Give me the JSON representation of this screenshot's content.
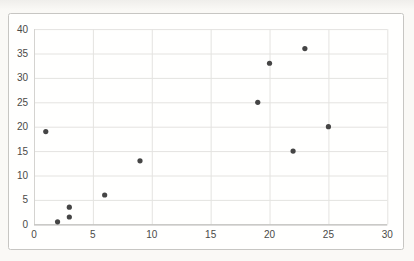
{
  "chart_data": {
    "type": "scatter",
    "title": "",
    "xlabel": "",
    "ylabel": "",
    "xlim": [
      0,
      30
    ],
    "ylim": [
      0,
      40
    ],
    "x_ticks": [
      0,
      5,
      10,
      15,
      20,
      25,
      30
    ],
    "y_ticks": [
      0,
      5,
      10,
      15,
      20,
      25,
      30,
      35,
      40
    ],
    "grid": "on",
    "legend": "none",
    "points": [
      [
        1,
        19
      ],
      [
        2,
        0.5
      ],
      [
        3,
        3.5
      ],
      [
        3,
        1.5
      ],
      [
        6,
        6
      ],
      [
        9,
        13
      ],
      [
        19,
        25
      ],
      [
        20,
        33
      ],
      [
        22,
        15
      ],
      [
        23,
        36
      ],
      [
        25,
        20
      ]
    ]
  },
  "style": {
    "marker_color": "#3b3b3b",
    "grid_color": "#e4e3e0",
    "axis_color": "#b9b8b5",
    "left_axis_color": "#d4d3d0",
    "tick_label_color": "#4a4a48",
    "frame_border_color": "#c7c6c3",
    "chart_bg": "#fffffe",
    "page_bg": "#faf9f6"
  }
}
